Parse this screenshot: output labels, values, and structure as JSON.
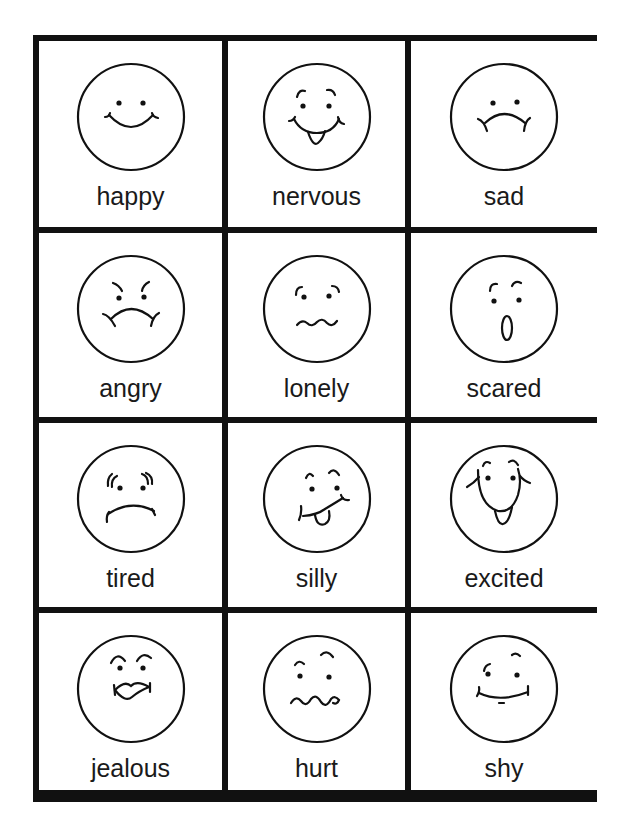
{
  "worksheet": {
    "colors": {
      "ink": "#111111",
      "paper": "#ffffff"
    },
    "cells": [
      {
        "label": "happy",
        "icon": "happy-face-icon"
      },
      {
        "label": "nervous",
        "icon": "nervous-face-icon"
      },
      {
        "label": "sad",
        "icon": "sad-face-icon"
      },
      {
        "label": "angry",
        "icon": "angry-face-icon"
      },
      {
        "label": "lonely",
        "icon": "lonely-face-icon"
      },
      {
        "label": "scared",
        "icon": "scared-face-icon"
      },
      {
        "label": "tired",
        "icon": "tired-face-icon"
      },
      {
        "label": "silly",
        "icon": "silly-face-icon"
      },
      {
        "label": "excited",
        "icon": "excited-face-icon"
      },
      {
        "label": "jealous",
        "icon": "jealous-face-icon"
      },
      {
        "label": "hurt",
        "icon": "hurt-face-icon"
      },
      {
        "label": "shy",
        "icon": "shy-face-icon"
      }
    ]
  }
}
